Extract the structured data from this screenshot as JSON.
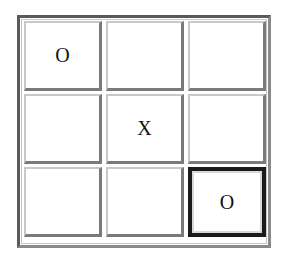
{
  "game": "tic-tac-toe",
  "board": [
    [
      "O",
      "",
      ""
    ],
    [
      "",
      "X",
      ""
    ],
    [
      "",
      "",
      "O"
    ]
  ],
  "selected_cell": {
    "row": 2,
    "col": 2
  }
}
